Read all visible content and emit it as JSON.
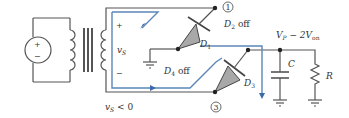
{
  "diagram": {
    "colors": {
      "wire": "#555555",
      "current_path": "#5b86b8",
      "diode_fill": "#a8a8a8",
      "background": "#ffffff"
    },
    "source": {
      "plus": "+",
      "minus": "−"
    },
    "secondary": {
      "plus": "+",
      "minus": "−",
      "voltage_label": "v",
      "voltage_sub": "S",
      "condition_label": "v",
      "condition_sub": "S",
      "condition_rest": " < 0"
    },
    "nodes": {
      "node1": "1",
      "node3": "3"
    },
    "diodes": {
      "d1": {
        "label": "D",
        "sub": "1"
      },
      "d2": {
        "label": "D",
        "sub": "2",
        "state": " off"
      },
      "d3": {
        "label": "D",
        "sub": "3"
      },
      "d4": {
        "label": "D",
        "sub": "4",
        "state": " off"
      }
    },
    "output": {
      "voltage_prefix": "V",
      "voltage_sub_p": "P",
      "voltage_mid": " − 2V",
      "voltage_sub_on": "on"
    },
    "components": {
      "capacitor": "C",
      "resistor": "R"
    }
  }
}
